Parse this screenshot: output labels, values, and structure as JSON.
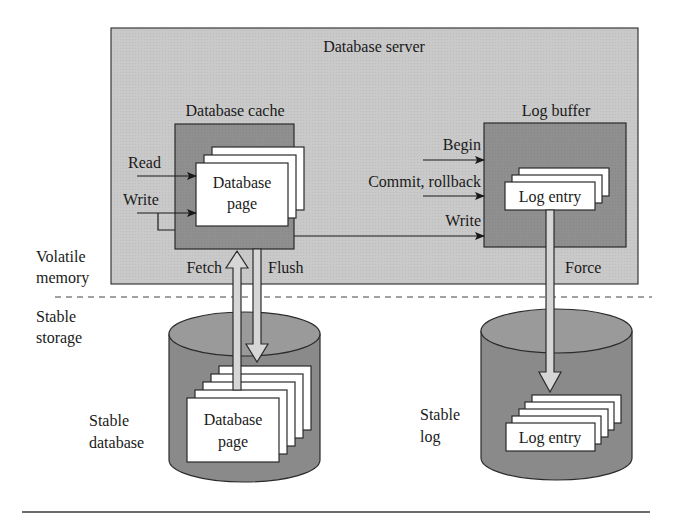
{
  "colors": {
    "server_bg": "#c9c9c9",
    "inner_box_bg": "#8f8f8f",
    "cylinder_bg": "#8a8a8a",
    "cylinder_top": "#9a9a9a",
    "page_bg": "#ffffff",
    "stroke": "#2b2b2b",
    "hollow_arrow_fill": "#d6d6d6"
  },
  "server": {
    "title": "Database server"
  },
  "cache": {
    "title": "Database cache",
    "page_line1": "Database",
    "page_line2": "page",
    "inputs": [
      "Read",
      "Write"
    ]
  },
  "log_buffer": {
    "title": "Log buffer",
    "entry": "Log entry",
    "inputs": [
      "Begin",
      "Commit, rollback",
      "Write"
    ]
  },
  "arrows": {
    "fetch": "Fetch",
    "flush": "Flush",
    "force": "Force"
  },
  "regions": {
    "volatile_line1": "Volatile",
    "volatile_line2": "memory",
    "stable_line1": "Stable",
    "stable_line2": "storage"
  },
  "stable_database": {
    "label_line1": "Stable",
    "label_line2": "database",
    "page_line1": "Database",
    "page_line2": "page"
  },
  "stable_log": {
    "label_line1": "Stable",
    "label_line2": "log",
    "entry": "Log entry"
  }
}
